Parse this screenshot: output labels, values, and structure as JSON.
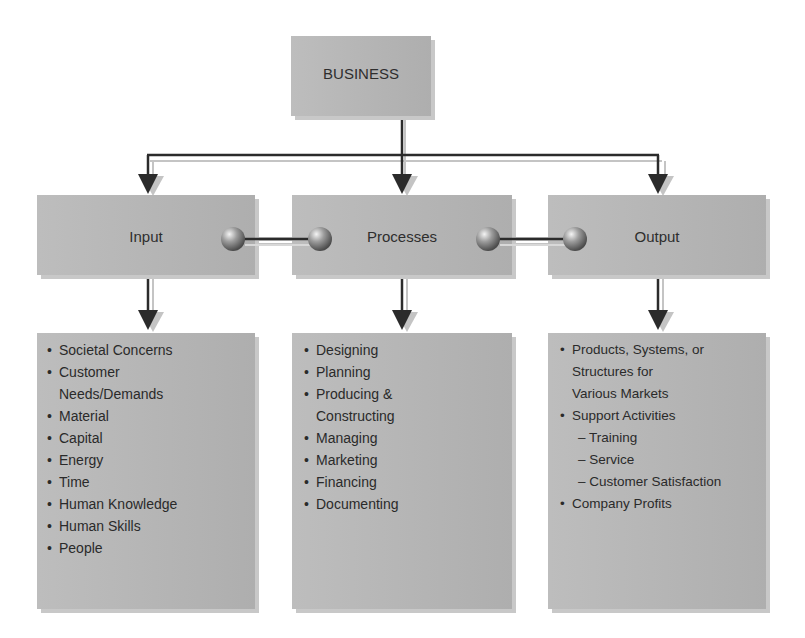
{
  "diagram": {
    "root": {
      "label": "BUSINESS"
    },
    "stages": [
      {
        "id": "input",
        "label": "Input"
      },
      {
        "id": "processes",
        "label": "Processes"
      },
      {
        "id": "output",
        "label": "Output"
      }
    ],
    "lists": {
      "input": [
        {
          "text": "Societal Concerns",
          "type": "bullet"
        },
        {
          "text": "Customer",
          "type": "bullet"
        },
        {
          "text": "Needs/Demands",
          "type": "cont"
        },
        {
          "text": "Material",
          "type": "bullet"
        },
        {
          "text": "Capital",
          "type": "bullet"
        },
        {
          "text": "Energy",
          "type": "bullet"
        },
        {
          "text": "Time",
          "type": "bullet"
        },
        {
          "text": "Human Knowledge",
          "type": "bullet"
        },
        {
          "text": "Human Skills",
          "type": "bullet"
        },
        {
          "text": "People",
          "type": "bullet"
        }
      ],
      "processes": [
        {
          "text": "Designing",
          "type": "bullet"
        },
        {
          "text": "Planning",
          "type": "bullet"
        },
        {
          "text": "Producing &",
          "type": "bullet"
        },
        {
          "text": "Constructing",
          "type": "cont"
        },
        {
          "text": "Managing",
          "type": "bullet"
        },
        {
          "text": "Marketing",
          "type": "bullet"
        },
        {
          "text": "Financing",
          "type": "bullet"
        },
        {
          "text": "Documenting",
          "type": "bullet"
        }
      ],
      "output": [
        {
          "text": "Products, Systems, or",
          "type": "bullet"
        },
        {
          "text": "Structures for",
          "type": "cont"
        },
        {
          "text": "Various Markets",
          "type": "cont"
        },
        {
          "text": "Support Activities",
          "type": "bullet"
        },
        {
          "text": "– Training",
          "type": "sub"
        },
        {
          "text": "– Service",
          "type": "sub"
        },
        {
          "text": "– Customer Satisfaction",
          "type": "sub"
        },
        {
          "text": "Company Profits",
          "type": "bullet"
        }
      ]
    },
    "colors": {
      "box_fill": "#b9b9b9",
      "box_shadow": "#c8c8c8",
      "line": "#2b2b2b",
      "line_shadow": "#bdbdbd",
      "text": "#2a2a2a"
    }
  }
}
